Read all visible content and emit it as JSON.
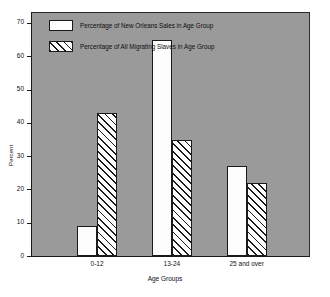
{
  "chart_data": {
    "type": "bar",
    "title": "",
    "subtitle": "",
    "xlabel": "Age Groups",
    "ylabel": "Percent",
    "categories": [
      "0-12",
      "13-24",
      "25 and over"
    ],
    "series": [
      {
        "name": "Percentage of New Orleans Sales in  Age Group",
        "style": "solid",
        "values": [
          9,
          65,
          27
        ]
      },
      {
        "name": "Percentage of All Migrating Slaves in Age Group",
        "style": "hatched",
        "values": [
          43,
          35,
          22
        ]
      }
    ],
    "ylim": [
      0,
      73
    ],
    "yticks": [
      0,
      10,
      20,
      30,
      40,
      50,
      60,
      70
    ],
    "ytick_labels": [
      "0",
      "10",
      "20",
      "30",
      "40",
      "50",
      "60",
      "70"
    ],
    "grid": false,
    "legend_position": "top-left-inside",
    "plot_background_color": "#9a9a9a",
    "figure_background_color": "#ffffff",
    "bar_fill_color": "#fdfdfd",
    "bar_edge_color": "#1a1a1a"
  },
  "legend": {
    "items": [
      {
        "label": "Percentage of New Orleans Sales in  Age Group",
        "style": "solid"
      },
      {
        "label": "Percentage of All Migrating Slaves in Age Group",
        "style": "hatched"
      }
    ]
  }
}
